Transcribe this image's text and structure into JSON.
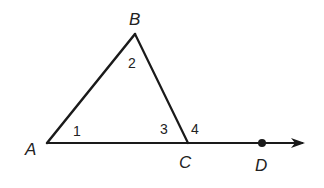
{
  "diagram": {
    "type": "triangle-with-exterior-angle",
    "points": {
      "A": {
        "label": "A",
        "x": 47,
        "y": 143
      },
      "B": {
        "label": "B",
        "x": 135,
        "y": 34
      },
      "C": {
        "label": "C",
        "x": 188,
        "y": 143
      },
      "D": {
        "label": "D",
        "x": 262,
        "y": 143
      }
    },
    "angles": [
      {
        "label": "1",
        "at": "A"
      },
      {
        "label": "2",
        "at": "B"
      },
      {
        "label": "3",
        "at": "C",
        "position": "interior"
      },
      {
        "label": "4",
        "at": "C",
        "position": "exterior"
      }
    ],
    "ray": {
      "from": "A",
      "through": "D",
      "arrow": true
    },
    "stroke_color": "#1a1a1a"
  }
}
